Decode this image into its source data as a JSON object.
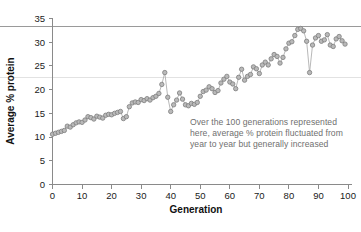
{
  "chart_data": {
    "type": "scatter",
    "title": "",
    "xlabel": "Generation",
    "ylabel": "Average % protein",
    "xlim": [
      0,
      100
    ],
    "ylim": [
      0,
      35
    ],
    "grid": false,
    "xticks": [
      0,
      10,
      20,
      30,
      40,
      50,
      60,
      70,
      80,
      90,
      100
    ],
    "yticks": [
      0,
      5,
      10,
      15,
      20,
      25,
      30,
      35
    ],
    "xtick_labels": [
      "0",
      "10",
      "20",
      "30",
      "40",
      "50",
      "60",
      "70",
      "80",
      "90",
      "100"
    ],
    "ytick_labels": [
      "0",
      "5",
      "10",
      "15",
      "20",
      "25",
      "30",
      "35"
    ],
    "legend": "",
    "marker": "open-circle-gray",
    "connected": true,
    "reference_lines": [
      {
        "name": "upper-rule",
        "y": 33.3,
        "color": "#9a9a9a",
        "style": "solid"
      },
      {
        "name": "lower-rule",
        "y": 22.6,
        "color": "#e2e2e2",
        "style": "solid"
      }
    ],
    "series": [
      {
        "name": "Average % protein per generation",
        "x": [
          0,
          1,
          2,
          3,
          4,
          5,
          6,
          7,
          8,
          9,
          10,
          11,
          12,
          13,
          14,
          15,
          16,
          17,
          18,
          19,
          20,
          21,
          22,
          23,
          24,
          25,
          26,
          27,
          28,
          29,
          30,
          31,
          32,
          33,
          34,
          35,
          36,
          37,
          38,
          39,
          40,
          41,
          42,
          43,
          44,
          45,
          46,
          47,
          48,
          49,
          50,
          51,
          52,
          53,
          54,
          55,
          56,
          57,
          58,
          59,
          60,
          61,
          62,
          63,
          64,
          65,
          66,
          67,
          68,
          69,
          70,
          71,
          72,
          73,
          74,
          75,
          76,
          77,
          78,
          79,
          80,
          81,
          82,
          83,
          84,
          85,
          86,
          87,
          88,
          89,
          90,
          91,
          92,
          93,
          94,
          95,
          96,
          97,
          98,
          99
        ],
        "values": [
          10.6,
          10.8,
          11.0,
          11.2,
          11.4,
          12.3,
          12.1,
          12.6,
          13.0,
          13.2,
          13.1,
          13.6,
          14.3,
          14.1,
          13.8,
          14.4,
          14.2,
          14.0,
          14.6,
          14.8,
          14.7,
          15.0,
          15.2,
          15.4,
          13.9,
          14.3,
          16.4,
          17.2,
          17.4,
          17.3,
          17.9,
          17.7,
          18.1,
          17.8,
          18.3,
          18.6,
          19.2,
          21.1,
          23.6,
          18.4,
          15.4,
          16.8,
          17.8,
          19.3,
          18.0,
          16.8,
          16.6,
          17.1,
          16.9,
          17.3,
          18.6,
          19.6,
          19.9,
          20.6,
          20.2,
          19.4,
          19.8,
          21.4,
          22.2,
          22.8,
          21.6,
          21.2,
          20.2,
          22.6,
          24.3,
          22.0,
          22.8,
          23.2,
          24.8,
          24.4,
          23.4,
          25.2,
          25.8,
          25.2,
          26.5,
          27.4,
          27.0,
          25.6,
          26.8,
          28.6,
          29.8,
          30.1,
          31.4,
          32.7,
          32.9,
          32.4,
          30.2,
          23.6,
          29.4,
          30.9,
          31.4,
          30.2,
          30.5,
          31.6,
          29.4,
          29.1,
          30.7,
          31.2,
          30.3,
          29.6
        ]
      }
    ],
    "annotation": {
      "name": "chart-annotation",
      "text": "Over the 100 generations represented here, average % protein fluctuated from year to year but generally increased",
      "color": "#6f6f6f"
    }
  },
  "colors": {
    "marker_fill": "#b9b9b9",
    "marker_stroke": "#7e7e7e",
    "line": "#b0b0b0",
    "axis": "#8a8a8a",
    "text": "#1a1a1a",
    "annotation": "#6f6f6f",
    "background": "#ffffff"
  }
}
